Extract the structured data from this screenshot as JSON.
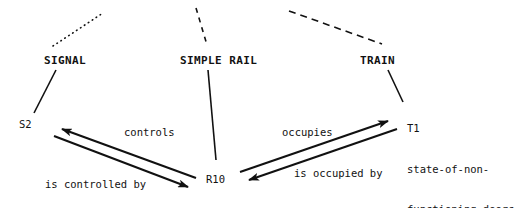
{
  "diagram": {
    "type": "entity-relationship-instance-diagram",
    "stroke_color": "#111111",
    "background_color": "#ffffff",
    "classes": [
      {
        "id": "signal",
        "label": "SIGNAL",
        "connector_above": "dotted"
      },
      {
        "id": "simple_rail",
        "label": "SIMPLE RAIL",
        "connector_above": "dashed-short"
      },
      {
        "id": "train",
        "label": "TRAIN",
        "connector_above": "dashed-long"
      }
    ],
    "instances": [
      {
        "id": "s2",
        "label": "S2",
        "of_class": "SIGNAL"
      },
      {
        "id": "r10",
        "label": "R10",
        "of_class": "SIMPLE RAIL"
      },
      {
        "id": "t1",
        "of_class": "TRAIN",
        "lines": [
          "T1",
          "state-of-non-",
          "functioning-doors"
        ]
      }
    ],
    "relations": [
      {
        "id": "controls",
        "label": "controls",
        "from": "R10",
        "to": "S2"
      },
      {
        "id": "is_controlled_by",
        "label": "is controlled by",
        "from": "S2",
        "to": "R10"
      },
      {
        "id": "occupies",
        "label": "occupies",
        "from": "R10",
        "to": "T1"
      },
      {
        "id": "is_occupied_by",
        "label": "is occupied by",
        "from": "T1",
        "to": "R10"
      }
    ]
  }
}
